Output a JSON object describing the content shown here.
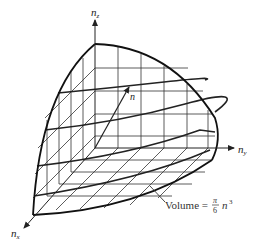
{
  "figure": {
    "type": "octant-of-sphere-in-n-space",
    "axes": {
      "z": {
        "label": "n",
        "subscript": "z"
      },
      "y": {
        "label": "n",
        "subscript": "y"
      },
      "x": {
        "label": "n",
        "subscript": "x"
      }
    },
    "vector": {
      "label": "n"
    },
    "annotation": {
      "prefix": "Volume = ",
      "fraction_numerator": "π",
      "fraction_denominator": "6",
      "suffix_base": "n",
      "suffix_exponent": "3"
    },
    "colors": {
      "ink": "#222222",
      "background": "#ffffff"
    }
  }
}
